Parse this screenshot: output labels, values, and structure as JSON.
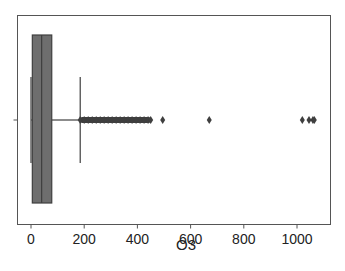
{
  "chart_data": {
    "type": "boxplot",
    "title": "",
    "xlabel": "O3",
    "ylabel": "",
    "orientation": "horizontal",
    "xlim": [
      -45,
      1115
    ],
    "xticks": [
      0,
      200,
      400,
      600,
      800,
      1000
    ],
    "xtick_labels": [
      "0",
      "200",
      "400",
      "600",
      "800",
      "1000"
    ],
    "grid": false,
    "legend": null,
    "box": {
      "whisker_low": 0,
      "q1": 5,
      "median": 40,
      "q3": 78,
      "whisker_high": 185,
      "fill_color": "#6e6e6e",
      "line_color": "#3f3f3f"
    },
    "outliers_dense_range": [
      185,
      450
    ],
    "outliers": [
      185,
      200,
      215,
      230,
      245,
      260,
      275,
      290,
      305,
      320,
      335,
      350,
      365,
      380,
      395,
      410,
      425,
      440,
      450,
      495,
      670,
      1020,
      1045,
      1060,
      1065
    ]
  }
}
